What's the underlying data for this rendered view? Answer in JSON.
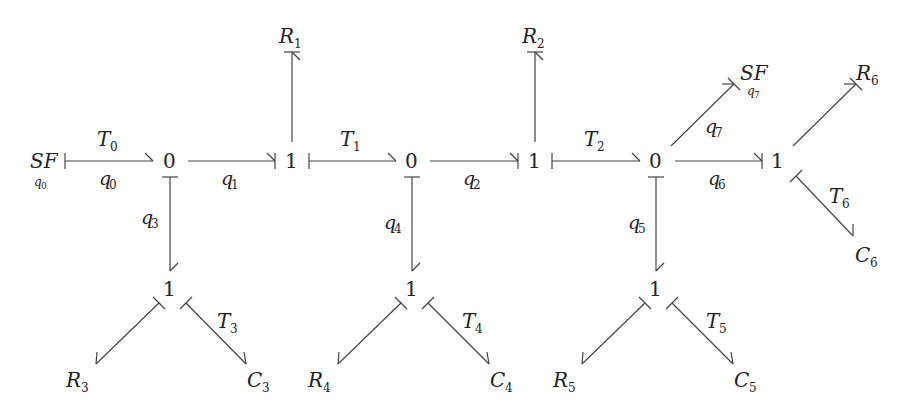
{
  "diagram": {
    "type": "bond-graph",
    "nodes": [
      {
        "id": "SF0",
        "label": "SF",
        "sub": "q0",
        "x": 46,
        "y": 161,
        "kind": "source"
      },
      {
        "id": "J0a",
        "label": "0",
        "x": 170,
        "y": 161,
        "kind": "junction"
      },
      {
        "id": "J1a",
        "label": "1",
        "x": 292,
        "y": 161,
        "kind": "junction"
      },
      {
        "id": "J0b",
        "label": "0",
        "x": 412,
        "y": 161,
        "kind": "junction"
      },
      {
        "id": "J1b",
        "label": "1",
        "x": 535,
        "y": 161,
        "kind": "junction"
      },
      {
        "id": "J0c",
        "label": "0",
        "x": 656,
        "y": 161,
        "kind": "junction"
      },
      {
        "id": "J1c",
        "label": "1",
        "x": 778,
        "y": 161,
        "kind": "junction"
      },
      {
        "id": "R1",
        "label": "R",
        "sub": "1",
        "x": 292,
        "y": 36,
        "kind": "element"
      },
      {
        "id": "R2",
        "label": "R",
        "sub": "2",
        "x": 535,
        "y": 36,
        "kind": "element"
      },
      {
        "id": "J1d",
        "label": "1",
        "x": 170,
        "y": 289,
        "kind": "junction"
      },
      {
        "id": "J1e",
        "label": "1",
        "x": 412,
        "y": 289,
        "kind": "junction"
      },
      {
        "id": "J1f",
        "label": "1",
        "x": 656,
        "y": 289,
        "kind": "junction"
      },
      {
        "id": "R3",
        "label": "R",
        "sub": "3",
        "x": 90,
        "y": 380,
        "kind": "element"
      },
      {
        "id": "C3",
        "label": "C",
        "sub": "3",
        "x": 262,
        "y": 380,
        "kind": "element"
      },
      {
        "id": "R4",
        "label": "R",
        "sub": "4",
        "x": 332,
        "y": 380,
        "kind": "element"
      },
      {
        "id": "C4",
        "label": "C",
        "sub": "4",
        "x": 506,
        "y": 380,
        "kind": "element"
      },
      {
        "id": "R5",
        "label": "R",
        "sub": "5",
        "x": 576,
        "y": 380,
        "kind": "element"
      },
      {
        "id": "C5",
        "label": "C",
        "sub": "5",
        "x": 748,
        "y": 380,
        "kind": "element"
      },
      {
        "id": "SF7",
        "label": "SF",
        "sub": "q7",
        "x": 834,
        "y": 72,
        "kind": "source"
      },
      {
        "id": "R6",
        "label": "R",
        "sub": "6",
        "x": 876,
        "y": 72,
        "kind": "element"
      },
      {
        "id": "C6",
        "label": "C",
        "sub": "6",
        "x": 876,
        "y": 258,
        "kind": "element"
      }
    ],
    "bonds": [
      {
        "from": "SF0",
        "to": "J0a",
        "above": "T0",
        "below": "q0"
      },
      {
        "from": "J0a",
        "to": "J1a",
        "below": "q1"
      },
      {
        "from": "J1a",
        "to": "R1"
      },
      {
        "from": "J1a",
        "to": "J0b",
        "above": "T1"
      },
      {
        "from": "J0b",
        "to": "J1b",
        "below": "q2"
      },
      {
        "from": "J1b",
        "to": "R2"
      },
      {
        "from": "J1b",
        "to": "J0c",
        "above": "T2"
      },
      {
        "from": "J0c",
        "to": "J1c",
        "below": "q6"
      },
      {
        "from": "J0c",
        "to": "SF7",
        "label": "q7"
      },
      {
        "from": "J1c",
        "to": "R6"
      },
      {
        "from": "J1c",
        "to": "C6",
        "label": "T6"
      },
      {
        "from": "J0a",
        "to": "J1d",
        "label": "q3"
      },
      {
        "from": "J0b",
        "to": "J1e",
        "label": "q4"
      },
      {
        "from": "J0c",
        "to": "J1f",
        "label": "q5"
      },
      {
        "from": "J1d",
        "to": "R3"
      },
      {
        "from": "J1d",
        "to": "C3",
        "label": "T3"
      },
      {
        "from": "J1e",
        "to": "R4"
      },
      {
        "from": "J1e",
        "to": "C4",
        "label": "T4"
      },
      {
        "from": "J1f",
        "to": "R5"
      },
      {
        "from": "J1f",
        "to": "C5",
        "label": "T5"
      }
    ]
  },
  "labels": {
    "sf0": "SF",
    "sf0_sub": "q",
    "sf0_sub_idx": "0",
    "j0a": "0",
    "j1a": "1",
    "j0b": "0",
    "j1b": "1",
    "j0c": "0",
    "j1c": "1",
    "j1d": "1",
    "j1e": "1",
    "j1f": "1",
    "r1": "R",
    "r1_sub": "1",
    "r2": "R",
    "r2_sub": "2",
    "r3": "R",
    "r3_sub": "3",
    "c3": "C",
    "c3_sub": "3",
    "r4": "R",
    "r4_sub": "4",
    "c4": "C",
    "c4_sub": "4",
    "r5": "R",
    "r5_sub": "5",
    "c5": "C",
    "c5_sub": "5",
    "sf7": "SF",
    "sf7_sub": "q",
    "sf7_sub_idx": "7",
    "r6": "R",
    "r6_sub": "6",
    "c6": "C",
    "c6_sub": "6",
    "t0": "T",
    "t0_sub": "0",
    "q0": "q",
    "q0_sub": "0",
    "q1": "q",
    "q1_sub": "1",
    "t1": "T",
    "t1_sub": "1",
    "q2": "q",
    "q2_sub": "2",
    "t2": "T",
    "t2_sub": "2",
    "q3": "q",
    "q3_sub": "3",
    "q4": "q",
    "q4_sub": "4",
    "q5": "q",
    "q5_sub": "5",
    "q6": "q",
    "q6_sub": "6",
    "q7": "q",
    "q7_sub": "7",
    "t3": "T",
    "t3_sub": "3",
    "t4": "T",
    "t4_sub": "4",
    "t5": "T",
    "t5_sub": "5",
    "t6": "T",
    "t6_sub": "6"
  }
}
